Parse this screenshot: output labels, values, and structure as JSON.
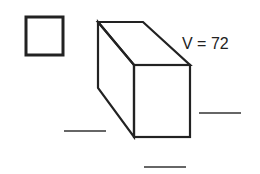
{
  "diagram": {
    "type": "rectangular-prism-volume",
    "volume_label": "V = 72",
    "volume_value": 72,
    "legend_square": {
      "description": "unit cube / answer box",
      "x": 25,
      "y": 16,
      "width": 39,
      "height": 40
    },
    "prism": {
      "back_top_left": [
        98,
        22
      ],
      "back_top_right": [
        143,
        22
      ],
      "back_bottom_left": [
        98,
        88
      ],
      "front_top_left": [
        134,
        65
      ],
      "front_top_right": [
        190,
        65
      ],
      "front_bottom_left": [
        134,
        137
      ],
      "front_bottom_right": [
        190,
        137
      ]
    },
    "answer_blanks": [
      {
        "name": "blank-left-depth",
        "x1": 64,
        "x2": 106,
        "y": 131,
        "value": ""
      },
      {
        "name": "blank-right-height",
        "x1": 199,
        "x2": 241,
        "y": 113,
        "value": ""
      },
      {
        "name": "blank-bottom-width",
        "x1": 144,
        "x2": 186,
        "y": 167,
        "value": ""
      }
    ],
    "colors": {
      "stroke": "#222222",
      "background": "#ffffff"
    }
  }
}
